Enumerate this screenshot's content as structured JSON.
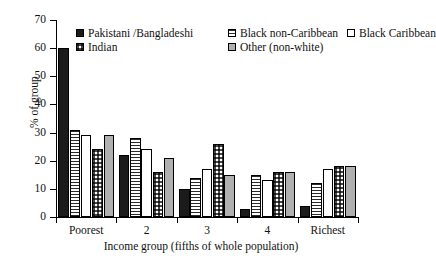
{
  "chart_data": {
    "type": "bar",
    "title": "",
    "xlabel": "Income group (fifths of whole population)",
    "ylabel": "% of group",
    "categories": [
      "Poorest",
      "2",
      "3",
      "4",
      "Richest"
    ],
    "ylim": [
      0,
      70
    ],
    "yticks": [
      0,
      10,
      20,
      30,
      40,
      50,
      60,
      70
    ],
    "grid": false,
    "legend_position": "upper-left-inside",
    "series": [
      {
        "name": "Pakistani /Bangladeshi",
        "pattern": "solid-black",
        "color": "#1b1b1b",
        "values": [
          60,
          22,
          10,
          3,
          4
        ]
      },
      {
        "name": "Black non-Caribbean",
        "pattern": "horizontal-stripes",
        "color": "#2b2b2b",
        "values": [
          31,
          28,
          14,
          15,
          12
        ]
      },
      {
        "name": "Black Caribbean",
        "pattern": "white",
        "color": "#ffffff",
        "values": [
          29,
          24,
          17,
          13,
          17
        ]
      },
      {
        "name": "Indian",
        "pattern": "checkerboard",
        "color": "#4a4a4a",
        "values": [
          24,
          16,
          26,
          16,
          18
        ]
      },
      {
        "name": "Other (non-white)",
        "pattern": "solid-gray",
        "color": "#b0b0b0",
        "values": [
          29,
          21,
          15,
          16,
          18
        ]
      }
    ]
  },
  "axis": {
    "y_tick_labels": [
      "0",
      "10",
      "20",
      "30",
      "40",
      "50",
      "60",
      "70"
    ],
    "x_tick_labels": [
      "Poorest",
      "2",
      "3",
      "4",
      "Richest"
    ],
    "y_title": "% of group",
    "x_title": "Income group (fifths of whole population)"
  },
  "legend": {
    "row1": [
      {
        "label": "Pakistani /Bangladeshi",
        "swatch": "solid-black-swatch"
      },
      {
        "label": "Black non-Caribbean",
        "swatch": "horizontal-stripes-swatch"
      },
      {
        "label": "Black Caribbean",
        "swatch": "white-swatch"
      }
    ],
    "row2": [
      {
        "label": "Indian",
        "swatch": "checkerboard-swatch"
      },
      {
        "label": "Other (non-white)",
        "swatch": "solid-gray-swatch"
      }
    ]
  }
}
